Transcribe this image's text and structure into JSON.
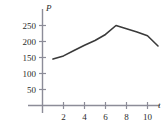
{
  "chart_data": {
    "type": "line",
    "title": "",
    "xlabel": "t",
    "ylabel": "P",
    "xlim": [
      0,
      11.8
    ],
    "ylim": [
      0,
      272
    ],
    "grid": false,
    "legend": false,
    "x_ticks": [
      2,
      4,
      6,
      8,
      10
    ],
    "y_ticks": [
      50,
      100,
      150,
      200,
      250
    ],
    "x_tick_labels": [
      "2",
      "4",
      "6",
      "8",
      "10"
    ],
    "y_tick_labels": [
      "50",
      "100",
      "150",
      "200",
      "250"
    ],
    "series": [
      {
        "name": "P",
        "x": [
          1,
          2,
          3,
          4,
          5,
          6,
          7,
          8,
          9,
          10,
          11
        ],
        "values": [
          145,
          155,
          172,
          188,
          203,
          222,
          250,
          240,
          230,
          218,
          186
        ]
      }
    ],
    "line_color": "#3a3a3a",
    "axis_color": "#8c8c98",
    "text_color": "#2b2b2b"
  },
  "axes": {
    "y_axis_label": "P",
    "x_axis_label": "t"
  }
}
